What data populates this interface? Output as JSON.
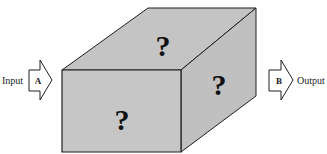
{
  "diagram": {
    "type": "black-box",
    "input": {
      "label": "Input",
      "arrow_letter": "A"
    },
    "output": {
      "label": "Output",
      "arrow_letter": "B"
    },
    "box": {
      "front_face_mark": "?",
      "top_face_mark": "?",
      "side_face_mark": "?"
    },
    "colors": {
      "face_fill": "#c4c4c4",
      "outline": "#1e1e1e",
      "arrow_fill": "#ffffff",
      "background": "#ffffff"
    }
  }
}
